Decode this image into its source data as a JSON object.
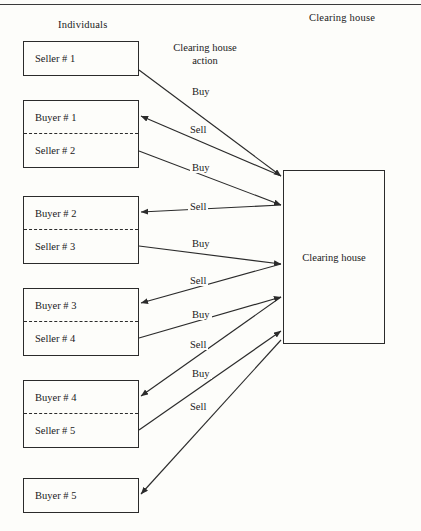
{
  "figure": {
    "background_color": "#fdfdfa",
    "line_color": "#2b2b2b",
    "column_titles": {
      "left": "Individuals",
      "middle": "Clearing house\naction",
      "middle_line1": "Clearing house",
      "middle_line2": "action",
      "right": "Clearing house"
    }
  },
  "clearing_house": {
    "label": "Clearing house"
  },
  "party_boxes": [
    {
      "id": "box-1",
      "rows": [
        {
          "label": "Seller # 1",
          "role": "seller",
          "divided": false
        }
      ]
    },
    {
      "id": "box-2",
      "rows": [
        {
          "label": "Buyer # 1",
          "role": "buyer",
          "divided": true
        },
        {
          "label": "Seller # 2",
          "role": "seller",
          "divided": false
        }
      ]
    },
    {
      "id": "box-3",
      "rows": [
        {
          "label": "Buyer # 2",
          "role": "buyer",
          "divided": true
        },
        {
          "label": "Seller # 3",
          "role": "seller",
          "divided": false
        }
      ]
    },
    {
      "id": "box-4",
      "rows": [
        {
          "label": "Buyer # 3",
          "role": "buyer",
          "divided": true
        },
        {
          "label": "Seller # 4",
          "role": "seller",
          "divided": false
        }
      ]
    },
    {
      "id": "box-5",
      "rows": [
        {
          "label": "Buyer # 4",
          "role": "buyer",
          "divided": true
        },
        {
          "label": "Seller # 5",
          "role": "seller",
          "divided": false
        }
      ]
    },
    {
      "id": "box-6",
      "rows": [
        {
          "label": "Buyer # 5",
          "role": "buyer",
          "divided": false
        }
      ]
    }
  ],
  "edges": [
    {
      "action": "Buy",
      "from": "Seller # 1",
      "to": "Clearing house",
      "direction": "to-clearing-house",
      "label_x": 190,
      "label_y": 86
    },
    {
      "action": "Sell",
      "from": "Clearing house",
      "to": "Buyer # 1",
      "direction": "to-individual",
      "label_x": 188,
      "label_y": 124
    },
    {
      "action": "Buy",
      "from": "Seller # 2",
      "to": "Clearing house",
      "direction": "to-clearing-house",
      "label_x": 190,
      "label_y": 162
    },
    {
      "action": "Sell",
      "from": "Clearing house",
      "to": "Buyer # 2",
      "direction": "to-individual",
      "label_x": 188,
      "label_y": 201
    },
    {
      "action": "Buy",
      "from": "Seller # 3",
      "to": "Clearing house",
      "direction": "to-clearing-house",
      "label_x": 190,
      "label_y": 238
    },
    {
      "action": "Sell",
      "from": "Clearing house",
      "to": "Buyer # 3",
      "direction": "to-individual",
      "label_x": 188,
      "label_y": 275
    },
    {
      "action": "Buy",
      "from": "Seller # 4",
      "to": "Clearing house",
      "direction": "to-clearing-house",
      "label_x": 190,
      "label_y": 309
    },
    {
      "action": "Sell",
      "from": "Clearing house",
      "to": "Buyer # 4",
      "direction": "to-individual",
      "label_x": 188,
      "label_y": 339
    },
    {
      "action": "Buy",
      "from": "Seller # 5",
      "to": "Clearing house",
      "direction": "to-clearing-house",
      "label_x": 190,
      "label_y": 368
    },
    {
      "action": "Sell",
      "from": "Clearing house",
      "to": "Buyer # 5",
      "direction": "to-individual",
      "label_x": 188,
      "label_y": 401
    }
  ]
}
